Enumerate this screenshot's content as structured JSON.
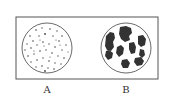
{
  "diagram": {
    "frame": {
      "x": 16,
      "y": 17,
      "w": 142,
      "h": 62,
      "stroke": "#555555"
    },
    "dishes": [
      {
        "label": "A",
        "cx": 47,
        "cy": 48,
        "r": 25,
        "pattern": "many small scattered dots"
      },
      {
        "label": "B",
        "cx": 126,
        "cy": 48,
        "r": 25,
        "pattern": "few large irregular dark colonies"
      }
    ],
    "colony_color": "#333333"
  }
}
